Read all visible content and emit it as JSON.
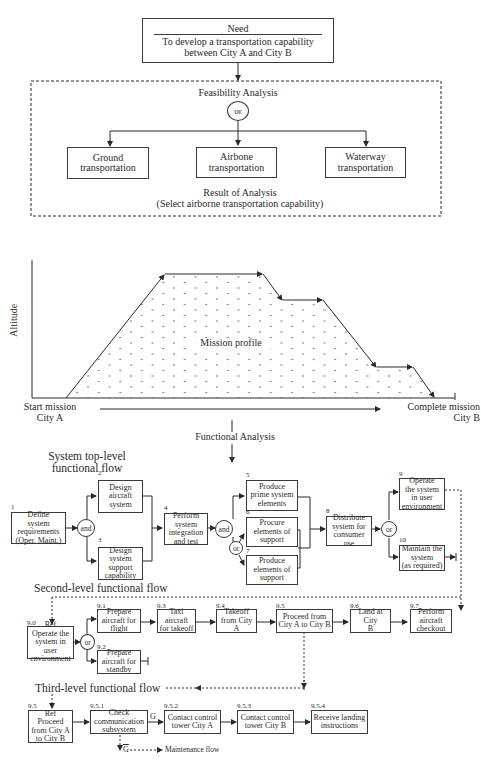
{
  "need": {
    "title": "Need",
    "text": "To develop a transportation capability\nbetween City A and City B"
  },
  "feasibility": {
    "title": "Feasibility Analysis",
    "gate": "or",
    "options": [
      {
        "label": "Ground\ntransportation"
      },
      {
        "label": "Airbone\ntransportation"
      },
      {
        "label": "Waterway\ntransportation"
      }
    ],
    "result": "Result of Analysis\n(Select airborne transportation capability)"
  },
  "mission_profile": {
    "y_axis_label": "Altitude",
    "center_label": "Mission profile",
    "start_label": "Start mission\nCity A",
    "end_label": "Complete mission\nCity B",
    "profile_points": [
      [
        65,
        423
      ],
      [
        163,
        275
      ],
      [
        262,
        275
      ],
      [
        283,
        300
      ],
      [
        323,
        300
      ],
      [
        376,
        367
      ],
      [
        412,
        367
      ],
      [
        433,
        423
      ]
    ]
  },
  "functional_analysis": {
    "label": "Functional Analysis"
  },
  "top_level": {
    "title": "System top-level\nfunctional flow",
    "blocks": [
      {
        "num": "1",
        "label": "Define\nsystem\nrequirements\n(Oper. Maint.)"
      },
      {
        "num": "2",
        "label": "Design\naircraft\nsystem"
      },
      {
        "num": "3",
        "label": "Design\nsystem\nsupport\ncapability"
      },
      {
        "num": "4",
        "label": "Perform\nsystem\nintegration\nand test"
      },
      {
        "num": "5",
        "label": "Produce\nprime system\nelements"
      },
      {
        "num": "6",
        "label": "Procure\nelements of\nsupport"
      },
      {
        "num": "7",
        "label": "Produce\nelements of\nsupport"
      },
      {
        "num": "8",
        "label": "Distribute\nsystem for\nconsumer use"
      },
      {
        "num": "9",
        "label": "Operate\nthe system\nin user\nenvironment"
      },
      {
        "num": "10",
        "label": "Maintain the\nsystem\n(as required)"
      }
    ],
    "gates": [
      "and",
      "and",
      "or",
      "or"
    ]
  },
  "second_level": {
    "title": "Second-level functional flow",
    "blocks": [
      {
        "num": "9.0",
        "label": "Ref\nOperate the\nsystem in user\nenvironment"
      },
      {
        "num": "9.1",
        "label": "Prepare\naircraft for\nflight"
      },
      {
        "num": "9.2",
        "label": "Prepare\naircraft for\nstandby"
      },
      {
        "num": "9.3",
        "label": "Taxi aircraft\nfor takeoff"
      },
      {
        "num": "9.4",
        "label": "Takeoff\nfrom City A"
      },
      {
        "num": "9.5",
        "label": "Proceed from\nCity A to City B"
      },
      {
        "num": "9.6",
        "label": "Land at City\nB"
      },
      {
        "num": "9.7",
        "label": "Perform\naircraft\ncheckout"
      }
    ],
    "gate": "or"
  },
  "third_level": {
    "title": "Third-level functional flow",
    "blocks": [
      {
        "num": "9.5",
        "label": "Ref\nProceed\nfrom City A\nto City B"
      },
      {
        "num": "9.5.1",
        "label": "Check\ncommunication\nsubsystem"
      },
      {
        "num": "9.5.2",
        "label": "Contact control\ntower City A"
      },
      {
        "num": "9.5.3",
        "label": "Contact control\ntower City B"
      },
      {
        "num": "9.5.4",
        "label": "Receive landing\ninstructions"
      }
    ],
    "go_label": "G",
    "nogo_label": "G",
    "maintenance_label": "Maintenance flow"
  }
}
